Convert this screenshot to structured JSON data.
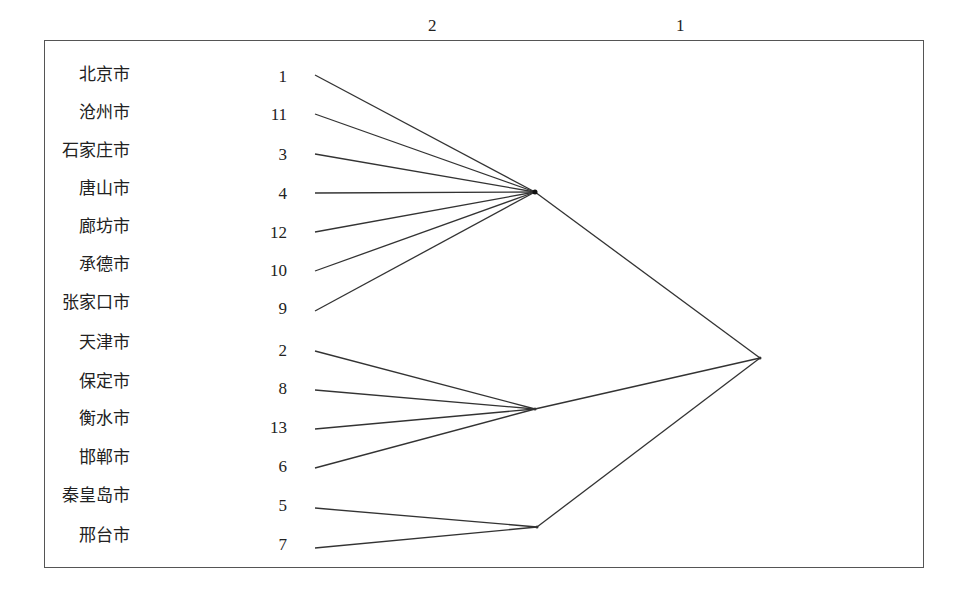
{
  "diagram": {
    "type": "cluster-dendrogram",
    "level_labels": [
      "2",
      "1"
    ],
    "leaves": [
      {
        "name": "北京市",
        "id": "1"
      },
      {
        "name": "沧州市",
        "id": "11"
      },
      {
        "name": "石家庄市",
        "id": "3"
      },
      {
        "name": "唐山市",
        "id": "4"
      },
      {
        "name": "廊坊市",
        "id": "12"
      },
      {
        "name": "承德市",
        "id": "10"
      },
      {
        "name": "张家口市",
        "id": "9"
      },
      {
        "name": "天津市",
        "id": "2"
      },
      {
        "name": "保定市",
        "id": "8"
      },
      {
        "name": "衡水市",
        "id": "13"
      },
      {
        "name": "邯郸市",
        "id": "6"
      },
      {
        "name": "秦皇岛市",
        "id": "5"
      },
      {
        "name": "邢台市",
        "id": "7"
      }
    ],
    "clusters_level2": [
      {
        "members": [
          "1",
          "11",
          "3",
          "4",
          "12",
          "10",
          "9"
        ]
      },
      {
        "members": [
          "2",
          "8",
          "13",
          "6"
        ]
      },
      {
        "members": [
          "5",
          "7"
        ]
      }
    ],
    "clusters_level1": [
      {
        "members": [
          "1",
          "11",
          "3",
          "4",
          "12",
          "10",
          "9",
          "2",
          "8",
          "13",
          "6",
          "5",
          "7"
        ]
      }
    ],
    "line_color": "#333333"
  }
}
